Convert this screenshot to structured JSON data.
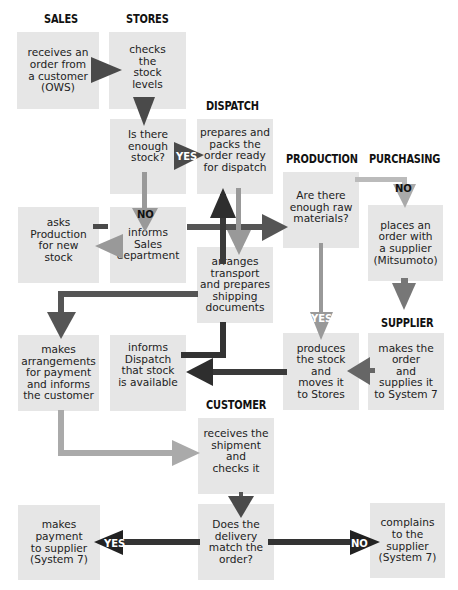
{
  "headers": {
    "sales": "SALES",
    "stores": "STORES",
    "dispatch": "DISPATCH",
    "production": "PRODUCTION",
    "purchasing": "PURCHASING",
    "supplier": "SUPPLIER",
    "customer": "CUSTOMER"
  },
  "boxes": {
    "receives_order": "receives an\norder from\na customer\n(OWS)",
    "checks_stock": "checks\nthe\nstock\nlevels",
    "enough_stock": "Is there\nenough\nstock?",
    "prepares_packs": "prepares and\npacks the\norder ready\nfor dispatch",
    "raw_materials": "Are there\nenough raw\nmaterials?",
    "places_order": "places an\norder with\na supplier\n(Mitsumoto)",
    "asks_production": "asks\nProduction\nfor new\nstock",
    "informs_sales": "informs\nSales\ndepartment",
    "arranges_transport": "arranges\ntransport\nand prepares\nshipping\ndocuments",
    "makes_arrangements": "makes\narrangements\nfor payment\nand informs\nthe customer",
    "informs_dispatch": "informs\nDispatch\nthat stock\nis available",
    "produces_stock": "produces\nthe stock\nand\nmoves it\nto Stores",
    "makes_order": "makes the\norder\nand\nsupplies it\nto System 7",
    "receives_shipment": "receives the\nshipment\nand\nchecks it",
    "delivery_match": "Does the\ndelivery\nmatch the\norder?",
    "makes_payment": "makes\npayment\nto supplier\n(System 7)",
    "complains": "complains\nto the\nsupplier\n(System 7)"
  },
  "labels": {
    "yes_stock": "YES",
    "no_stock": "NO",
    "no_materials": "NO",
    "yes_materials": "YES",
    "yes_delivery": "YES",
    "no_delivery": "NO"
  },
  "colors": {
    "box": "#e6e6e6",
    "dark_arrow": "#3a3a3a",
    "mid_arrow": "#555555",
    "light_arrow": "#9a9a9a",
    "header": "#111111"
  }
}
